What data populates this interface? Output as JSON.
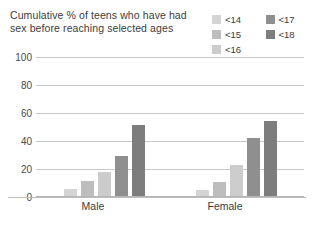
{
  "chart": {
    "title": "Cumulative % of teens who have had sex before reaching selected ages"
  },
  "legend": {
    "items": [
      {
        "label": "<14",
        "color": "#d4d4d4"
      },
      {
        "label": "<17",
        "color": "#8f8f8f"
      },
      {
        "label": "<15",
        "color": "#bdbdbd"
      },
      {
        "label": "<18",
        "color": "#7d7d7d"
      },
      {
        "label": "<16",
        "color": "#cccccc"
      }
    ]
  },
  "axis": {
    "yticks": [
      "100",
      "80",
      "60",
      "40",
      "20",
      "0"
    ],
    "categories": [
      "Male",
      "Female"
    ]
  },
  "chart_data": {
    "type": "bar",
    "title": "Cumulative % of teens who have had sex before reaching selected ages",
    "xlabel": "",
    "ylabel": "",
    "ylim": [
      0,
      100
    ],
    "yticks": [
      0,
      20,
      40,
      60,
      80,
      100
    ],
    "grid": true,
    "legend_position": "top-right",
    "categories": [
      "Male",
      "Female"
    ],
    "series": [
      {
        "name": "<14",
        "color": "#d4d4d4",
        "values": [
          5,
          4
        ]
      },
      {
        "name": "<15",
        "color": "#bdbdbd",
        "values": [
          11,
          10
        ]
      },
      {
        "name": "<16",
        "color": "#cccccc",
        "values": [
          17,
          22
        ]
      },
      {
        "name": "<17",
        "color": "#8f8f8f",
        "values": [
          29,
          42
        ]
      },
      {
        "name": "<18",
        "color": "#7d7d7d",
        "values": [
          51,
          54
        ]
      }
    ]
  }
}
